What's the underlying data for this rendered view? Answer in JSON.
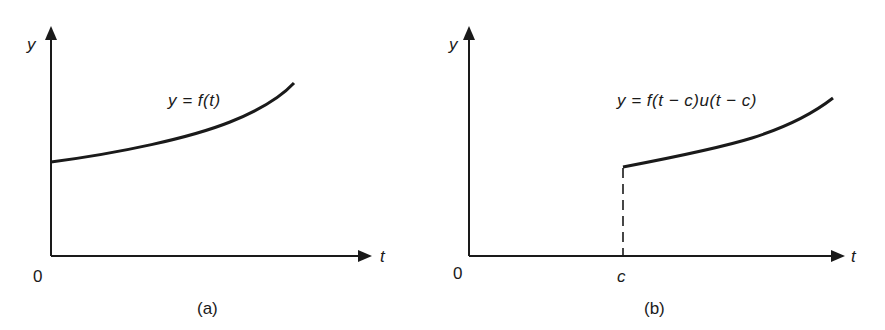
{
  "figure": {
    "panels": [
      {
        "id": "a",
        "caption": "(a)",
        "y_axis_label": "y",
        "x_axis_label": "t",
        "origin_label": "0",
        "curve_label": "y = f(t)",
        "description": "Increasing curve y = f(t) starting at positive y-intercept on the y-axis"
      },
      {
        "id": "b",
        "caption": "(b)",
        "y_axis_label": "y",
        "x_axis_label": "t",
        "origin_label": "0",
        "shift_label": "c",
        "curve_label": "y = f(t − c)u(t − c)",
        "description": "Same curve shifted right by c; zero for t < c, dashed vertical line at t = c"
      }
    ]
  },
  "colors": {
    "ink": "#1a1a1a",
    "background": "#ffffff"
  }
}
